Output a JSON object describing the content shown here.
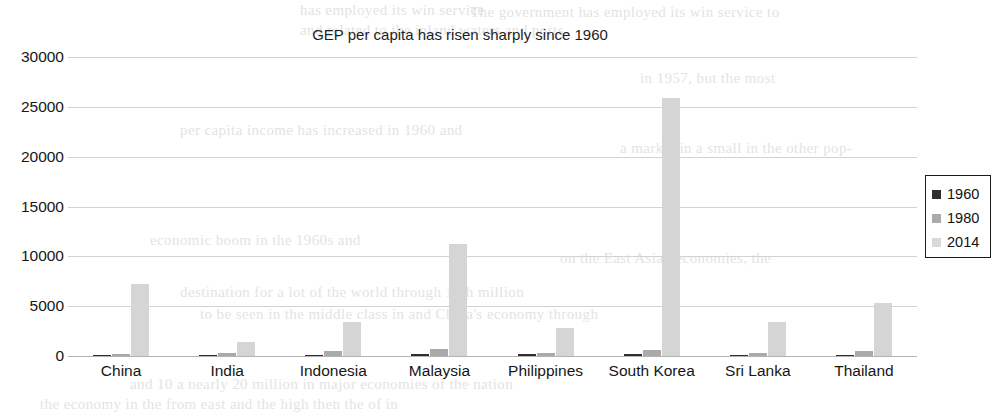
{
  "chart_data": {
    "type": "bar",
    "title": "GEP per capita has risen sharply since 1960",
    "xlabel": "",
    "ylabel": "",
    "ylim": [
      0,
      30000
    ],
    "ytick_step": 5000,
    "yticks": [
      "0",
      "5000",
      "10000",
      "15000",
      "20000",
      "25000",
      "30000"
    ],
    "grid": true,
    "legend_position": "right",
    "categories": [
      "China",
      "India",
      "Indonesia",
      "Malaysia",
      "Philippines",
      "South Korea",
      "Sri Lanka",
      "Thailand"
    ],
    "series": [
      {
        "name": "1960",
        "color": "#2e2e2e",
        "values": [
          90,
          80,
          95,
          230,
          180,
          160,
          140,
          100
        ]
      },
      {
        "name": "1980",
        "color": "#aaaaaa",
        "values": [
          190,
          270,
          490,
          700,
          350,
          600,
          270,
          480
        ]
      },
      {
        "name": "2014",
        "color": "#d5d5d5",
        "values": [
          7200,
          1400,
          3400,
          11200,
          2800,
          25900,
          3400,
          5300
        ]
      }
    ]
  },
  "legend": {
    "items": [
      {
        "label": "1960",
        "swatch": "s1960"
      },
      {
        "label": "1980",
        "swatch": "s1980"
      },
      {
        "label": "2014",
        "swatch": "s2014"
      }
    ]
  },
  "ghost_text": [
    {
      "text": "has employed its win service",
      "x": 300,
      "y": 2,
      "size": 15
    },
    {
      "text": "The government has employed its win service to",
      "x": 470,
      "y": 4,
      "size": 15
    },
    {
      "text": "and related to the inland waters and ports.",
      "x": 300,
      "y": 22,
      "size": 15
    },
    {
      "text": "in 1957, but the most",
      "x": 640,
      "y": 70,
      "size": 15
    },
    {
      "text": "per capita income has increased in 1960 and",
      "x": 180,
      "y": 122,
      "size": 15
    },
    {
      "text": "a market in a small in the other pop-",
      "x": 620,
      "y": 140,
      "size": 15
    },
    {
      "text": "economic boom in the 1960s and",
      "x": 150,
      "y": 232,
      "size": 15
    },
    {
      "text": "on the East Asian economies, the",
      "x": 560,
      "y": 250,
      "size": 15
    },
    {
      "text": "destination for a lot of the world through 10th million",
      "x": 180,
      "y": 284,
      "size": 15
    },
    {
      "text": "to be seen in the middle class in and China's economy through",
      "x": 200,
      "y": 306,
      "size": 15
    },
    {
      "text": "and 10 a nearly 20 million in major economies of the nation",
      "x": 130,
      "y": 376,
      "size": 15
    },
    {
      "text": "the economy in the from east and the high then the of in",
      "x": 40,
      "y": 396,
      "size": 15
    }
  ]
}
